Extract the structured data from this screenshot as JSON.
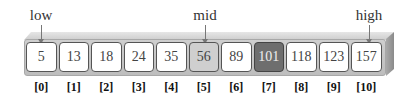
{
  "pointers": {
    "low": {
      "label": "low",
      "index": 0
    },
    "mid": {
      "label": "mid",
      "index": 5
    },
    "high": {
      "label": "high",
      "index": 10
    }
  },
  "array": {
    "values": [
      "5",
      "13",
      "18",
      "24",
      "35",
      "56",
      "89",
      "101",
      "118",
      "123",
      "157"
    ],
    "indices": [
      "[0]",
      "[1]",
      "[2]",
      "[3]",
      "[4]",
      "[5]",
      "[6]",
      "[7]",
      "[8]",
      "[9]",
      "[10]"
    ],
    "highlight": {
      "mid_index": 5,
      "target_index": 7
    },
    "colors": {
      "cell": "#ffffff",
      "mid": "#cfcfcf",
      "target": "#6e6e6e"
    }
  }
}
